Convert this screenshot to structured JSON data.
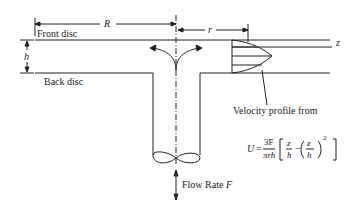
{
  "diagram": {
    "labels": {
      "front_disc": "Front disc",
      "back_disc": "Back disc",
      "radius_R": "R",
      "radius_r": "r",
      "gap_h": "h",
      "axis_z": "z",
      "velocity_caption": "Velocity profile from",
      "flow_rate": "Flow Rate",
      "flow_symbol": "F"
    },
    "equation": {
      "lhs": "U",
      "eq": "=",
      "num": "3F",
      "den": "πrh",
      "z1": "z",
      "h1": "h",
      "minus": "−",
      "z2": "z",
      "h2": "h",
      "power": "2"
    }
  }
}
